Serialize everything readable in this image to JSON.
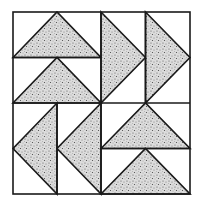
{
  "diagram": {
    "colors": {
      "background": "#ffffff",
      "line": "#1a1a1a",
      "fill_base": "#d8d8d8",
      "speckle": "#555555"
    },
    "bounds": {
      "x0": 13,
      "y0": 12,
      "x1": 190,
      "y1": 194,
      "cx": 101,
      "cy": 103
    },
    "quadrants": [
      {
        "name": "top-left",
        "orientation": "horizontal",
        "direction": "up",
        "units": 2
      },
      {
        "name": "top-right",
        "orientation": "vertical",
        "direction": "right",
        "units": 2
      },
      {
        "name": "bottom-left",
        "orientation": "vertical",
        "direction": "left",
        "units": 2
      },
      {
        "name": "bottom-right",
        "orientation": "horizontal",
        "direction": "up",
        "units": 2
      }
    ]
  }
}
